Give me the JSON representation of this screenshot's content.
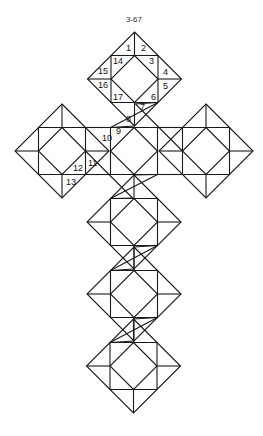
{
  "figure": {
    "caption": "3-67",
    "stroke_color": "#1a1a1a",
    "background": "#ffffff",
    "block_half_size": 47,
    "blocks": [
      {
        "id": "top",
        "cx": 134.5,
        "cy": 79
      },
      {
        "id": "left",
        "cx": 62,
        "cy": 151
      },
      {
        "id": "right",
        "cx": 206,
        "cy": 151
      },
      {
        "id": "center-1",
        "cx": 134,
        "cy": 151,
        "partial": true
      },
      {
        "id": "center-2",
        "cx": 134,
        "cy": 222
      },
      {
        "id": "center-3",
        "cx": 134,
        "cy": 294
      },
      {
        "id": "center-4",
        "cx": 133.5,
        "cy": 366
      }
    ],
    "labels": [
      {
        "text": "1",
        "x": 126,
        "y": 51
      },
      {
        "text": "2",
        "x": 141,
        "y": 51
      },
      {
        "text": "3",
        "x": 149,
        "y": 64
      },
      {
        "text": "4",
        "x": 163,
        "y": 75
      },
      {
        "text": "5",
        "x": 163,
        "y": 89
      },
      {
        "text": "6",
        "x": 151,
        "y": 100
      },
      {
        "text": "7",
        "x": 140,
        "y": 110
      },
      {
        "text": "8",
        "x": 126,
        "y": 122
      },
      {
        "text": "9",
        "x": 116,
        "y": 134
      },
      {
        "text": "10",
        "x": 102,
        "y": 141
      },
      {
        "text": "11",
        "x": 88,
        "y": 166
      },
      {
        "text": "12",
        "x": 73,
        "y": 171
      },
      {
        "text": "13",
        "x": 66,
        "y": 185
      },
      {
        "text": "14",
        "x": 113,
        "y": 64
      },
      {
        "text": "15",
        "x": 98,
        "y": 74
      },
      {
        "text": "16",
        "x": 98,
        "y": 88
      },
      {
        "text": "17",
        "x": 113,
        "y": 100
      }
    ]
  }
}
